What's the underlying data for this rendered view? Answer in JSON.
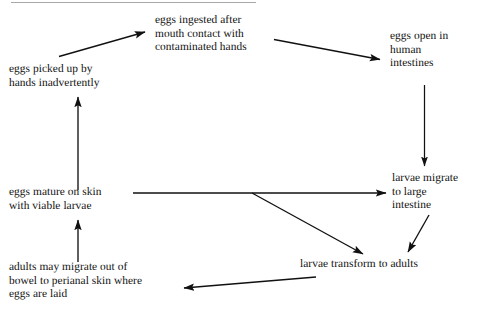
{
  "diagram": {
    "background_color": "#ffffff",
    "line_color": "#111111",
    "text_color": "#111111",
    "top_rule_color": "#a8a8a8",
    "nodes": {
      "eggs_picked_up": "eggs picked up by\nhands inadvertently",
      "eggs_ingested": "eggs ingested after\nmouth contact with\ncontaminated hands",
      "eggs_open": "eggs open in\nhuman\nintestines",
      "larvae_migrate": "larvae migrate\nto large\nintestine",
      "eggs_mature": "eggs mature on skin\nwith viable larvae",
      "larvae_transform": "larvae transform to adults",
      "adults_migrate": "adults may migrate out of\nbowel to perianal skin where\neggs are laid"
    },
    "edges": [
      {
        "name": "eggs-picked-up-to-eggs-ingested",
        "from": "eggs_picked_up",
        "to": "eggs_ingested",
        "style": "diagonal-up-right"
      },
      {
        "name": "eggs-ingested-to-eggs-open",
        "from": "eggs_ingested",
        "to": "eggs_open",
        "style": "diagonal-down-right"
      },
      {
        "name": "eggs-open-to-larvae-migrate",
        "from": "eggs_open",
        "to": "larvae_migrate",
        "style": "vertical-down"
      },
      {
        "name": "eggs-mature-to-larvae-migrate",
        "from": "eggs_mature",
        "to": "larvae_migrate",
        "style": "horizontal-right"
      },
      {
        "name": "eggs-mature-branch-to-larvae-transform",
        "from": "eggs_mature",
        "to": "larvae_transform",
        "style": "branch-diagonal-down-right"
      },
      {
        "name": "larvae-migrate-to-larvae-transform",
        "from": "larvae_migrate",
        "to": "larvae_transform",
        "style": "diagonal-down-left"
      },
      {
        "name": "larvae-transform-to-adults-migrate",
        "from": "larvae_transform",
        "to": "adults_migrate",
        "style": "horizontal-left"
      },
      {
        "name": "adults-migrate-to-eggs-mature",
        "from": "adults_migrate",
        "to": "eggs_mature",
        "style": "vertical-up"
      },
      {
        "name": "eggs-mature-to-eggs-picked-up",
        "from": "eggs_mature",
        "to": "eggs_picked_up",
        "style": "vertical-up"
      }
    ]
  }
}
